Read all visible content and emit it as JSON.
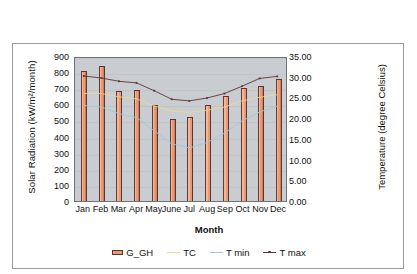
{
  "chart_data": {
    "type": "bar",
    "title": "",
    "categories": [
      "Jan",
      "Feb",
      "Mar",
      "Apr",
      "May",
      "June",
      "Jul",
      "Aug",
      "Sep",
      "Oct",
      "Nov",
      "Dec"
    ],
    "xlabel": "Month",
    "ylabel": "Solar Radiation (kW/m²/month)",
    "y2label": "Temperature (degree Celsius)",
    "ylim": [
      0,
      900
    ],
    "y2lim": [
      0,
      35
    ],
    "y_ticks": [
      "0",
      "100",
      "200",
      "300",
      "400",
      "500",
      "600",
      "700",
      "800",
      "900"
    ],
    "y2_ticks": [
      "0.00",
      "5.00",
      "10.00",
      "15.00",
      "20.00",
      "25.00",
      "30.00",
      "35.00"
    ],
    "grid": true,
    "legend_position": "bottom",
    "series": [
      {
        "name": "G_GH",
        "kind": "bar",
        "axis": "left",
        "unit": "kWh/m2/month",
        "color": "#e79a78",
        "values": [
          810,
          840,
          680,
          690,
          595,
          508,
          520,
          595,
          650,
          700,
          715,
          755
        ]
      },
      {
        "name": "TC",
        "kind": "line",
        "axis": "right",
        "unit": "degree Celsius",
        "color": "#f2d98a",
        "values": [
          26.3,
          26.3,
          25.5,
          25.0,
          23.3,
          22.0,
          21.7,
          22.2,
          23.0,
          24.5,
          25.4,
          26.0
        ]
      },
      {
        "name": "T min",
        "kind": "line",
        "axis": "right",
        "unit": "degree Celsius",
        "color": "#9ec8e0",
        "values": [
          23.4,
          23.0,
          21.4,
          20.4,
          17.2,
          14.0,
          13.0,
          14.3,
          16.6,
          19.6,
          21.8,
          23.2
        ]
      },
      {
        "name": "T max",
        "kind": "line",
        "axis": "right",
        "unit": "degree Celsius",
        "color": "#5d3434",
        "values": [
          30.6,
          30.1,
          29.3,
          28.9,
          27.0,
          24.9,
          24.5,
          25.2,
          26.3,
          28.1,
          30.0,
          30.5
        ]
      }
    ]
  },
  "legend": {
    "items": [
      {
        "label": "G_GH",
        "marker": "bar-swatch",
        "color": "#e79a78"
      },
      {
        "label": "TC",
        "marker": "line-swatch",
        "color": "#f2d98a"
      },
      {
        "label": "T min",
        "marker": "line-swatch",
        "color": "#9ec8e0"
      },
      {
        "label": "T max",
        "marker": "line-marker-swatch",
        "color": "#5d3434"
      }
    ]
  }
}
